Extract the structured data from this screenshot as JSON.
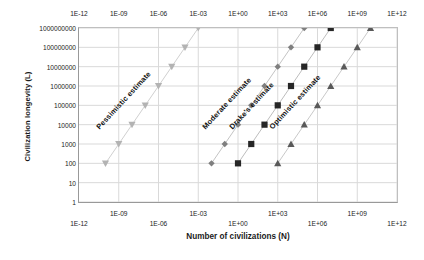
{
  "chart_data": {
    "type": "line",
    "title": "",
    "xlabel": "Number of civilizations (N)",
    "ylabel": "Civilization longevity (L)",
    "xscale": "log",
    "yscale": "log",
    "xlim": [
      1e-12,
      1000000000000.0
    ],
    "ylim": [
      1,
      1000000000
    ],
    "grid": true,
    "legend": "none",
    "x_tick_labels": [
      "1E-12",
      "1E-09",
      "1E-06",
      "1E-03",
      "1E+00",
      "1E+03",
      "1E+06",
      "1E+09",
      "1E+12"
    ],
    "x_tick_values": [
      1e-12,
      1e-09,
      1e-06,
      0.001,
      1,
      1000,
      1000000,
      1000000000,
      1000000000000
    ],
    "y_tick_labels": [
      "1000000000",
      "100000000",
      "10000000",
      "1000000",
      "100000",
      "10000",
      "1000",
      "100",
      "10",
      "1"
    ],
    "y_tick_values": [
      1000000000,
      100000000,
      10000000,
      1000000,
      100000,
      10000,
      1000,
      100,
      10,
      1
    ],
    "x_axis_top_labels": [
      "1E-12",
      "1E-09",
      "1E-06",
      "1E-03",
      "1E+00",
      "1E+03",
      "1E+06",
      "1E+09",
      "1E+12"
    ],
    "series": [
      {
        "name": "Pessimistic estimate",
        "marker": "triangle-down",
        "color": "#b3b3b3",
        "line_color": "#d0d0d0",
        "label_angle": -47,
        "points": [
          {
            "x": 1e-10,
            "y": 100
          },
          {
            "x": 1e-09,
            "y": 1000
          },
          {
            "x": 1e-08,
            "y": 10000
          },
          {
            "x": 1e-07,
            "y": 100000
          },
          {
            "x": 1e-06,
            "y": 1000000
          },
          {
            "x": 1e-05,
            "y": 10000000
          },
          {
            "x": 0.0001,
            "y": 100000000
          },
          {
            "x": 0.001,
            "y": 1000000000
          }
        ]
      },
      {
        "name": "Moderate estimate",
        "marker": "diamond",
        "color": "#7f7f7f",
        "line_color": "#c4c4c4",
        "label_angle": -47,
        "points": [
          {
            "x": 0.01,
            "y": 100
          },
          {
            "x": 0.1,
            "y": 1000
          },
          {
            "x": 1,
            "y": 10000
          },
          {
            "x": 10,
            "y": 100000
          },
          {
            "x": 100,
            "y": 1000000
          },
          {
            "x": 1000,
            "y": 10000000
          },
          {
            "x": 10000,
            "y": 100000000
          },
          {
            "x": 100000,
            "y": 1000000000
          }
        ]
      },
      {
        "name": "Drake's estimate",
        "marker": "square",
        "color": "#262626",
        "line_color": "#bdbdbd",
        "label_angle": -47,
        "points": [
          {
            "x": 1,
            "y": 100
          },
          {
            "x": 10,
            "y": 1000
          },
          {
            "x": 100,
            "y": 10000
          },
          {
            "x": 1000,
            "y": 100000
          },
          {
            "x": 10000,
            "y": 1000000
          },
          {
            "x": 100000,
            "y": 10000000
          },
          {
            "x": 1000000,
            "y": 100000000
          },
          {
            "x": 10000000,
            "y": 1000000000
          }
        ]
      },
      {
        "name": "Optimistic estimate",
        "marker": "triangle-up",
        "color": "#595959",
        "line_color": "#c9c9c9",
        "label_angle": -47,
        "points": [
          {
            "x": 1000,
            "y": 100
          },
          {
            "x": 10000,
            "y": 1000
          },
          {
            "x": 100000,
            "y": 10000
          },
          {
            "x": 1000000,
            "y": 100000
          },
          {
            "x": 10000000,
            "y": 1000000
          },
          {
            "x": 100000000,
            "y": 10000000
          },
          {
            "x": 1000000000,
            "y": 100000000
          },
          {
            "x": 10000000000,
            "y": 1000000000
          }
        ]
      }
    ]
  },
  "axes": {
    "x_title": "Number of civilizations (N)",
    "y_title": "Civilization longevity (L)"
  },
  "colors": {
    "grid": "#d9d9d9",
    "axis": "#8c8c8c",
    "text": "#1b1b1b",
    "background": "#ffffff"
  }
}
